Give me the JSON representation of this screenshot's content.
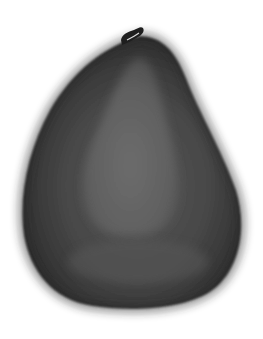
{
  "image": {
    "subject": "avocado fruit",
    "style": "grayscale photograph",
    "background_color": "#ffffff",
    "colors": {
      "body_dark": "#2a2a2a",
      "body_mid": "#4a4a4a",
      "inner_light": "#6a6a6a",
      "stem": "#1e1e1e"
    }
  }
}
